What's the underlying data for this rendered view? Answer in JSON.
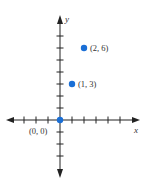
{
  "chart_data": {
    "type": "scatter",
    "title": "",
    "xlabel": "x",
    "ylabel": "y",
    "xlim": [
      -4,
      6
    ],
    "ylim": [
      -4,
      7
    ],
    "x_ticks": [
      -3,
      -2,
      -1,
      1,
      2,
      3,
      4,
      5
    ],
    "y_ticks": [
      -3,
      -2,
      -1,
      1,
      2,
      3,
      4,
      5,
      6,
      7
    ],
    "tick_labels_shown": false,
    "grid": false,
    "legend": null,
    "points": [
      {
        "x": 0,
        "y": 0,
        "label": "(0, 0)",
        "label_position": "below-left"
      },
      {
        "x": 1,
        "y": 3,
        "label": "(1, 3)",
        "label_position": "right"
      },
      {
        "x": 2,
        "y": 6,
        "label": "(2, 6)",
        "label_position": "right"
      }
    ],
    "colors": {
      "point": "#1a6fd6",
      "axis": "#222222",
      "text": "#333333"
    }
  },
  "layout": {
    "origin_px": [
      60,
      120
    ],
    "unit_px": 12
  }
}
